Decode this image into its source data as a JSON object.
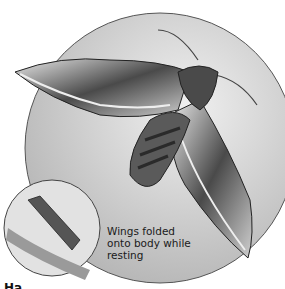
{
  "illustration": {
    "subject": "hawk moth",
    "caption": "Wings folded onto body while resting",
    "caption_lines": [
      "Wings folded",
      "onto body while",
      "resting"
    ],
    "partial_heading": "Ha",
    "colors": {
      "circle_fill": "#c9c9c9",
      "circle_stroke": "#555555",
      "wing_dark": "#3a3a3a",
      "wing_light": "#d8d8d8",
      "background": "#ffffff"
    }
  }
}
